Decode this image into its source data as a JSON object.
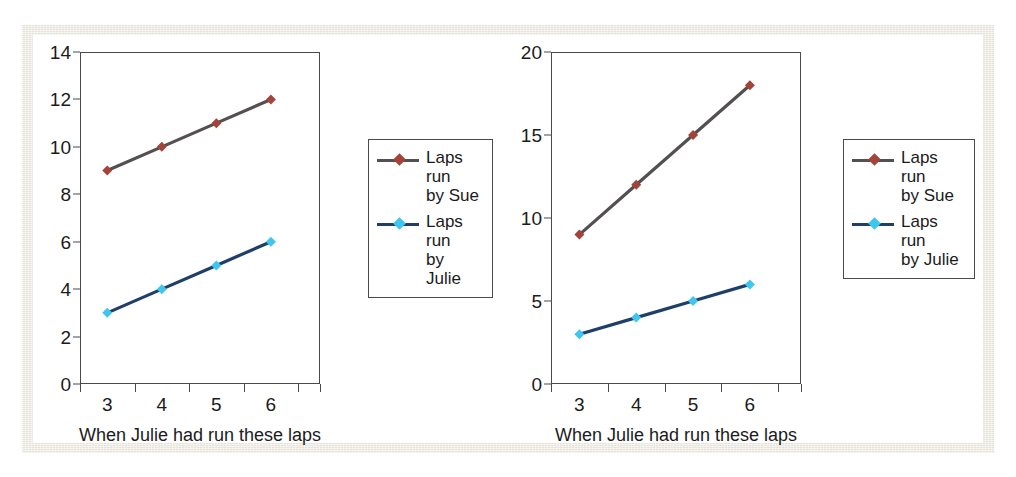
{
  "figure": {
    "frame_color": "#e6e4da",
    "background": "#ffffff"
  },
  "series_style": {
    "sue_line_color": "#53504f",
    "sue_marker_color": "#a4433a",
    "julie_line_color": "#1f3f6b",
    "julie_marker_color": "#3fc6ef"
  },
  "chart_data": [
    {
      "type": "line",
      "id": "left-chart",
      "title": "",
      "xlabel": "When Julie had run these laps",
      "ylabel": "",
      "x": [
        3,
        4,
        5,
        6
      ],
      "xticklabels": [
        "3",
        "4",
        "5",
        "6"
      ],
      "yticklabels": [
        "0",
        "2",
        "4",
        "6",
        "8",
        "10",
        "12",
        "14"
      ],
      "yticks": [
        0,
        2,
        4,
        6,
        8,
        10,
        12,
        14
      ],
      "ylim": [
        0,
        14
      ],
      "xlim": [
        2.5,
        6.9
      ],
      "grid": false,
      "legend_position": "right",
      "series": [
        {
          "name": "Laps run by Sue",
          "label_line1": "Laps run",
          "label_line2": "by Sue",
          "values": [
            9,
            10,
            11,
            12
          ]
        },
        {
          "name": "Laps run by Julie",
          "label_line1": "Laps run",
          "label_line2": "by Julie",
          "values": [
            3,
            4,
            5,
            6
          ]
        }
      ]
    },
    {
      "type": "line",
      "id": "right-chart",
      "title": "",
      "xlabel": "When Julie had run these laps",
      "ylabel": "",
      "x": [
        3,
        4,
        5,
        6
      ],
      "xticklabels": [
        "3",
        "4",
        "5",
        "6"
      ],
      "yticklabels": [
        "0",
        "5",
        "10",
        "15",
        "20"
      ],
      "yticks": [
        0,
        5,
        10,
        15,
        20
      ],
      "ylim": [
        0,
        20
      ],
      "xlim": [
        2.5,
        6.9
      ],
      "grid": false,
      "legend_position": "right",
      "series": [
        {
          "name": "Laps run by Sue",
          "label_line1": "Laps run",
          "label_line2": "by Sue",
          "values": [
            9,
            12,
            15,
            18
          ]
        },
        {
          "name": "Laps run by Julie",
          "label_line1": "Laps run",
          "label_line2": "by Julie",
          "values": [
            3,
            4,
            5,
            6
          ]
        }
      ]
    }
  ]
}
